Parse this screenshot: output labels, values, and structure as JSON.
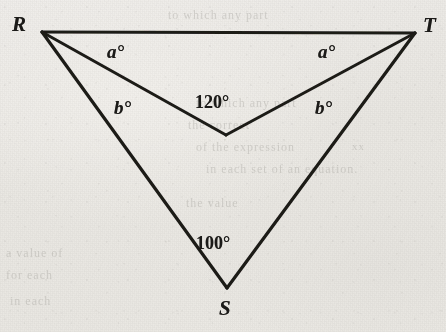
{
  "figure": {
    "type": "geometry-diagram",
    "canvas": {
      "width": 446,
      "height": 332
    },
    "background_color": "#eceae5",
    "line_color": "#1b1a18",
    "text_color": "#1b1a18",
    "vertices": [
      {
        "id": "R",
        "label": "R",
        "x": 42,
        "y": 32,
        "label_x": 12,
        "label_y": 12
      },
      {
        "id": "T",
        "label": "T",
        "x": 415,
        "y": 33,
        "label_x": 423,
        "label_y": 13
      },
      {
        "id": "S",
        "label": "S",
        "x": 227,
        "y": 288,
        "label_x": 219,
        "label_y": 296
      },
      {
        "id": "P",
        "label": "",
        "x": 226,
        "y": 135,
        "label_x": 0,
        "label_y": 0
      }
    ],
    "segments": [
      {
        "name": "RT",
        "from": "R",
        "to": "T"
      },
      {
        "name": "RP",
        "from": "R",
        "to": "P"
      },
      {
        "name": "TP",
        "from": "T",
        "to": "P"
      },
      {
        "name": "RS",
        "from": "R",
        "to": "S"
      },
      {
        "name": "TS",
        "from": "T",
        "to": "S"
      }
    ],
    "angle_labels": [
      {
        "name": "angle-a-left",
        "text": "a°",
        "x": 107,
        "y": 41,
        "style": "variable"
      },
      {
        "name": "angle-a-right",
        "text": "a°",
        "x": 318,
        "y": 41,
        "style": "variable"
      },
      {
        "name": "angle-b-left",
        "text": "b°",
        "x": 114,
        "y": 97,
        "style": "variable"
      },
      {
        "name": "angle-b-right",
        "text": "b°",
        "x": 315,
        "y": 97,
        "style": "variable"
      },
      {
        "name": "angle-120",
        "text": "120°",
        "x": 195,
        "y": 92,
        "style": "numeric"
      },
      {
        "name": "angle-100",
        "text": "100°",
        "x": 196,
        "y": 233,
        "style": "numeric"
      }
    ]
  },
  "ghost_text": {
    "line1": "to which any part",
    "line2": "to which any part",
    "line3": "the correct",
    "line4": "of the expression",
    "line5": "in each set of an equation.",
    "line6": "the value",
    "line7": "a value of",
    "line8": "for each",
    "line9": "in each",
    "line10": "xx"
  }
}
